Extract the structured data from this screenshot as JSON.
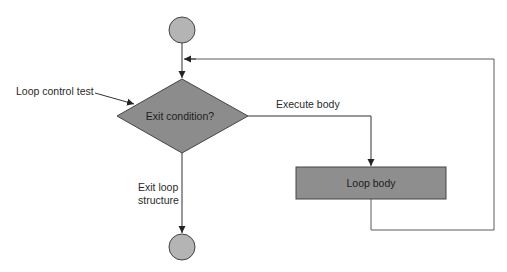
{
  "diagram": {
    "type": "flowchart",
    "nodes": {
      "start": {
        "shape": "circle",
        "label": ""
      },
      "decision": {
        "shape": "diamond",
        "label": "Exit condition?"
      },
      "body": {
        "shape": "rectangle",
        "label": "Loop body"
      },
      "end": {
        "shape": "circle",
        "label": ""
      }
    },
    "edges": {
      "start_to_decision": {
        "from": "start",
        "to": "decision",
        "label": ""
      },
      "decision_to_body": {
        "from": "decision",
        "to": "body",
        "label": "Execute body"
      },
      "body_to_decision": {
        "from": "body",
        "to": "decision",
        "label": ""
      },
      "decision_to_end": {
        "from": "decision",
        "to": "end",
        "label": "Exit loop structure",
        "label_lines": [
          "Exit loop",
          "structure"
        ]
      }
    },
    "annotations": {
      "loop_control": {
        "label": "Loop control test",
        "points_to": "decision"
      }
    },
    "colors": {
      "circle_fill": "#b4b4b4",
      "diamond_fill": "#8c8c8c",
      "rect_fill": "#8e8e8e",
      "stroke": "#333333",
      "background": "#ffffff"
    }
  }
}
